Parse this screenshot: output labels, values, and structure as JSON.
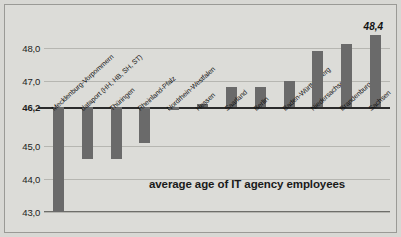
{
  "chart_data": {
    "type": "bar",
    "title": "average age of IT agency employees",
    "xlabel": "",
    "ylabel": "",
    "ylim": [
      43.0,
      48.6
    ],
    "baseline": 46.2,
    "baseline_label": "46,2",
    "grid": true,
    "legend": null,
    "y_ticks": [
      {
        "value": 48.0,
        "label": "48,0",
        "bold": false
      },
      {
        "value": 47.0,
        "label": "47,0",
        "bold": false
      },
      {
        "value": 46.2,
        "label": "46,2",
        "bold": true
      },
      {
        "value": 45.0,
        "label": "45,0",
        "bold": false
      },
      {
        "value": 44.0,
        "label": "44,0",
        "bold": false
      },
      {
        "value": 43.0,
        "label": "43,0",
        "bold": false
      }
    ],
    "categories": [
      "Mecklenburg-Vorpommern",
      "dataport (HH, HB, SH, ST)",
      "Thüringen",
      "Rheinland-Pfalz",
      "Nordrhein-Westfalen",
      "Hessen",
      "Saarland",
      "Berlin",
      "Baden-Württemberg",
      "Niedersachsen",
      "Brandenburg",
      "Sachsen"
    ],
    "values": [
      43.0,
      44.6,
      44.6,
      45.1,
      46.1,
      46.3,
      46.8,
      46.8,
      47.0,
      47.9,
      48.1,
      48.4
    ],
    "data_labels": [
      {
        "index": 11,
        "text": "48,4"
      }
    ],
    "colors": {
      "bar": "#6a6a6a",
      "background": "#dcdcd8",
      "gridline": "#b6b6b1",
      "baseline": "#2b2b2b",
      "text": "#111111"
    }
  }
}
